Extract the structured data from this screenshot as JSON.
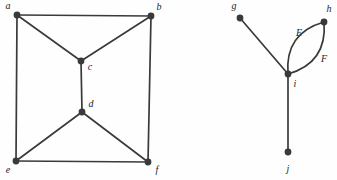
{
  "figure": {
    "name": "two-undirected-graphs-figure",
    "background_color": "#fefefe",
    "ink_color": "#3a3a3a",
    "label_color": "#1d1d1d",
    "width": 337,
    "height": 180
  },
  "graphs": [
    {
      "id": "left-graph",
      "name": "left-graph",
      "vertex_radius": 3.4,
      "edge_width": 1.7,
      "vertices": [
        {
          "id": "a",
          "label": "a",
          "x": 17,
          "y": 15,
          "label_x": 8,
          "label_y": 7,
          "label_size": 10
        },
        {
          "id": "b",
          "label": "b",
          "x": 151,
          "y": 16,
          "label_x": 159,
          "label_y": 8,
          "label_size": 10
        },
        {
          "id": "c",
          "label": "c",
          "x": 81,
          "y": 61,
          "label_x": 90,
          "label_y": 68,
          "label_size": 10
        },
        {
          "id": "d",
          "label": "d",
          "x": 82,
          "y": 112,
          "label_x": 91,
          "label_y": 105,
          "label_size": 10
        },
        {
          "id": "e",
          "label": "e",
          "x": 16,
          "y": 161,
          "label_x": 8,
          "label_y": 171,
          "label_size": 10
        },
        {
          "id": "f",
          "label": "f",
          "x": 148,
          "y": 162,
          "label_x": 157,
          "label_y": 171,
          "label_size": 10
        }
      ],
      "edges": [
        {
          "id": "a-b",
          "from": "a",
          "to": "b",
          "label": "",
          "curve": 0
        },
        {
          "id": "a-c",
          "from": "a",
          "to": "c",
          "label": "",
          "curve": 0
        },
        {
          "id": "a-e",
          "from": "a",
          "to": "e",
          "label": "",
          "curve": 0
        },
        {
          "id": "b-c",
          "from": "b",
          "to": "c",
          "label": "",
          "curve": 0
        },
        {
          "id": "b-f",
          "from": "b",
          "to": "f",
          "label": "",
          "curve": 0
        },
        {
          "id": "c-d",
          "from": "c",
          "to": "d",
          "label": "",
          "curve": 0
        },
        {
          "id": "d-e",
          "from": "d",
          "to": "e",
          "label": "",
          "curve": 0
        },
        {
          "id": "d-f",
          "from": "d",
          "to": "f",
          "label": "",
          "curve": 0
        },
        {
          "id": "e-f",
          "from": "e",
          "to": "f",
          "label": "",
          "curve": 0
        }
      ]
    },
    {
      "id": "right-graph",
      "name": "right-graph",
      "vertex_radius": 3.4,
      "edge_width": 1.7,
      "vertices": [
        {
          "id": "g",
          "label": "g",
          "x": 240,
          "y": 18,
          "label_x": 234,
          "label_y": 7,
          "label_size": 10
        },
        {
          "id": "h",
          "label": "h",
          "x": 324,
          "y": 22,
          "label_x": 329,
          "label_y": 10,
          "label_size": 10
        },
        {
          "id": "i",
          "label": "i",
          "x": 288,
          "y": 74,
          "label_x": 295,
          "label_y": 85,
          "label_size": 10
        },
        {
          "id": "j",
          "label": "j",
          "x": 288,
          "y": 152,
          "label_x": 288,
          "label_y": 170,
          "label_size": 10
        }
      ],
      "edges": [
        {
          "id": "g-i",
          "from": "g",
          "to": "i",
          "label": "",
          "curve": 0
        },
        {
          "id": "h-i-E",
          "from": "h",
          "to": "i",
          "label": "E",
          "label_x": 299,
          "label_y": 34,
          "label_size": 10,
          "curve": -13
        },
        {
          "id": "h-i-F",
          "from": "h",
          "to": "i",
          "label": "F",
          "label_x": 324,
          "label_y": 60,
          "label_size": 10,
          "curve": 13
        },
        {
          "id": "i-j",
          "from": "i",
          "to": "j",
          "label": "",
          "curve": 0
        }
      ]
    }
  ]
}
